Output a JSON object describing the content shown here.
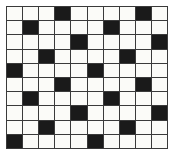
{
  "figure": {
    "type": "grid",
    "rows": 10,
    "columns": 10,
    "colors": {
      "empty_cell": "#fbfbf8",
      "filled_cell": "#1a1a1a",
      "grid_line": "#3a3a3a",
      "background": "#ffffff"
    },
    "cell_width_px": 16,
    "cell_height_px": 14,
    "grid_left_px": 6,
    "grid_top_px": 6
  },
  "chart_data": {
    "type": "heatmap",
    "title": "",
    "xlabel": "",
    "ylabel": "",
    "grid": true,
    "legend": "none",
    "categories_x": [
      "1",
      "2",
      "3",
      "4",
      "5",
      "6",
      "7",
      "8",
      "9",
      "10"
    ],
    "categories_y": [
      "1",
      "2",
      "3",
      "4",
      "5",
      "6",
      "7",
      "8",
      "9",
      "10"
    ],
    "values": [
      [
        0,
        0,
        0,
        1,
        0,
        0,
        0,
        0,
        1,
        0
      ],
      [
        0,
        1,
        0,
        0,
        0,
        0,
        1,
        0,
        0,
        0
      ],
      [
        0,
        0,
        0,
        0,
        1,
        0,
        0,
        0,
        0,
        1
      ],
      [
        0,
        0,
        1,
        0,
        0,
        0,
        0,
        1,
        0,
        0
      ],
      [
        1,
        0,
        0,
        0,
        0,
        1,
        0,
        0,
        0,
        0
      ],
      [
        0,
        0,
        0,
        1,
        0,
        0,
        0,
        0,
        1,
        0
      ],
      [
        0,
        1,
        0,
        0,
        0,
        0,
        1,
        0,
        0,
        0
      ],
      [
        0,
        0,
        0,
        0,
        1,
        0,
        0,
        0,
        0,
        1
      ],
      [
        0,
        0,
        1,
        0,
        0,
        0,
        0,
        1,
        0,
        0
      ],
      [
        1,
        0,
        0,
        0,
        0,
        1,
        0,
        0,
        0,
        0
      ]
    ],
    "filled_cell_count": 20,
    "empty_cell_count": 80,
    "filled_coordinates": [
      [
        1,
        4
      ],
      [
        1,
        9
      ],
      [
        2,
        2
      ],
      [
        2,
        7
      ],
      [
        3,
        5
      ],
      [
        3,
        10
      ],
      [
        4,
        3
      ],
      [
        4,
        8
      ],
      [
        5,
        1
      ],
      [
        5,
        6
      ],
      [
        6,
        4
      ],
      [
        6,
        9
      ],
      [
        7,
        2
      ],
      [
        7,
        7
      ],
      [
        8,
        5
      ],
      [
        8,
        10
      ],
      [
        9,
        3
      ],
      [
        9,
        8
      ],
      [
        10,
        1
      ],
      [
        10,
        6
      ]
    ]
  }
}
